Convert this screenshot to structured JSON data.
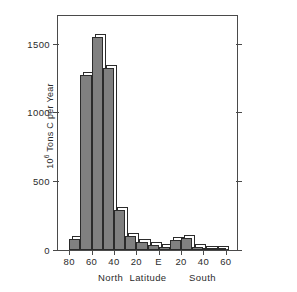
{
  "chart_data": {
    "type": "bar",
    "title": "",
    "subtitle": "",
    "xlabel": "Latitude",
    "ylabel": "10⁶ Tons C per Year",
    "ylabel_base": "10",
    "ylabel_exp": "6",
    "ylabel_rest": " Tons C per Year",
    "hemisphere_left": "North",
    "hemisphere_right": "South",
    "grid": false,
    "legend": false,
    "xlim": [
      90,
      -70
    ],
    "ylim": [
      0,
      1700
    ],
    "yticks": [
      0,
      500,
      1000,
      1500
    ],
    "ytick_labels": [
      "0",
      "500",
      "1000",
      "1500"
    ],
    "xticks": [
      80,
      60,
      40,
      20,
      0,
      -20,
      -40,
      -60
    ],
    "xtick_labels": [
      "80",
      "60",
      "40",
      "20",
      "E",
      "20",
      "40",
      "60"
    ],
    "bin_width": 10,
    "bar_fill_color": "#808080",
    "bar_edge_color": "#2b2b2b",
    "bar_shadow_color": "#ffffff",
    "frame_color": "#4a4a4a",
    "categories": [
      "70–80 N",
      "60–70 N",
      "50–60 N",
      "40–50 N",
      "30–40 N",
      "20–30 N",
      "10–20 N",
      "0–10 N",
      "0–10 S",
      "10–20 S",
      "20–30 S",
      "30–40 S",
      "40–50 S",
      "50–60 S",
      "60–70 S"
    ],
    "bin_left_latitudes": [
      80,
      70,
      60,
      50,
      40,
      30,
      20,
      10,
      0,
      -10,
      -20,
      -30,
      -40,
      -50,
      -60
    ],
    "values": [
      80,
      1275,
      1545,
      1320,
      290,
      105,
      60,
      35,
      25,
      70,
      90,
      20,
      10,
      5,
      0
    ]
  },
  "figure": {
    "background": "#ffffff"
  }
}
